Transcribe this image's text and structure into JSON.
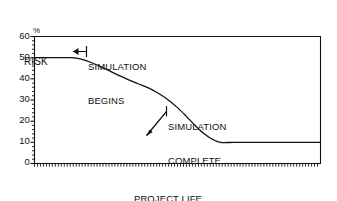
{
  "chart_data": {
    "type": "line",
    "title": "",
    "xlabel": "PROJECT LIFE CYCLE",
    "ylabel": "RISK",
    "yunit": "%",
    "xlim": [
      0,
      100
    ],
    "ylim": [
      0,
      60
    ],
    "grid": false,
    "legend": false,
    "y_ticks": [
      0,
      10,
      20,
      30,
      40,
      50,
      60
    ],
    "y_tick_labels": [
      "0",
      "10",
      "20",
      "30",
      "40",
      "50",
      "60"
    ],
    "y_minor_tick_step": 2,
    "x_ticks": [],
    "x_tick_labels": [],
    "x_minor_ticks": true,
    "series": [
      {
        "name": "Risk over project life cycle",
        "x": [
          0,
          5,
          10,
          13,
          16,
          20,
          24,
          28,
          32,
          36,
          40,
          44,
          47,
          50,
          53,
          56,
          59,
          62,
          65,
          70,
          80,
          90,
          100
        ],
        "y": [
          50,
          50,
          50,
          50,
          49.4,
          47.6,
          45.2,
          42.6,
          40.1,
          37.8,
          35.6,
          32.6,
          29.8,
          26.4,
          22.4,
          18.2,
          14.4,
          11.6,
          10,
          10,
          10,
          10,
          10
        ]
      }
    ],
    "annotations": [
      {
        "name": "simulation-begins",
        "lines": [
          "SIMULATION",
          "BEGINS"
        ],
        "arrow": "left",
        "points_to_x": 13,
        "points_to_y": 50
      },
      {
        "name": "simulation-complete",
        "lines": [
          "SIMULATION",
          "COMPLETE"
        ],
        "arrow": "down-left",
        "points_to_x": 65,
        "points_to_y": 10
      }
    ]
  },
  "axis": {
    "y_title_unit": "%",
    "y_title_name": "RISK",
    "x_title_line1": "PROJECT LIFE",
    "x_title_line2": "CYCLE",
    "tick_0": "0",
    "tick_10": "10",
    "tick_20": "20",
    "tick_30": "30",
    "tick_40": "40",
    "tick_50": "50",
    "tick_60": "60"
  },
  "annotations": {
    "begins_line1": "SIMULATION",
    "begins_line2": "BEGINS",
    "complete_line1": "SIMULATION",
    "complete_line2": "COMPLETE"
  },
  "colors": {
    "ink": "#111111",
    "background": "#ffffff",
    "curve": "#111111"
  }
}
